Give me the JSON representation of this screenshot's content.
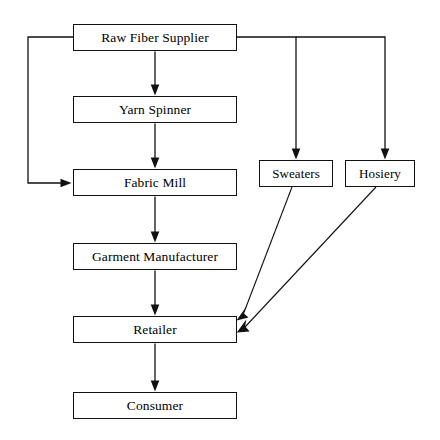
{
  "diagram": {
    "background_color": "#ffffff",
    "line_color": "#111111",
    "text_color": "#000000",
    "nodes": [
      {
        "id": "raw-fiber-supplier",
        "label": "Raw Fiber Supplier",
        "x": 73,
        "y": 24,
        "w": 164,
        "h": 27
      },
      {
        "id": "yarn-spinner",
        "label": "Yarn Spinner",
        "x": 73,
        "y": 96,
        "w": 164,
        "h": 27
      },
      {
        "id": "fabric-mill",
        "label": "Fabric Mill",
        "x": 73,
        "y": 169,
        "w": 164,
        "h": 27
      },
      {
        "id": "garment-manufacturer",
        "label": "Garment Manufacturer",
        "x": 73,
        "y": 243,
        "w": 164,
        "h": 27
      },
      {
        "id": "retailer",
        "label": "Retailer",
        "x": 73,
        "y": 316,
        "w": 164,
        "h": 27
      },
      {
        "id": "consumer",
        "label": "Consumer",
        "x": 73,
        "y": 392,
        "w": 164,
        "h": 27
      },
      {
        "id": "sweaters",
        "label": "Sweaters",
        "x": 259,
        "y": 160,
        "w": 74,
        "h": 27
      },
      {
        "id": "hosiery",
        "label": "Hosiery",
        "x": 345,
        "y": 160,
        "w": 70,
        "h": 27
      }
    ],
    "edges": [
      {
        "id": "raw-fiber-to-yarn-spinner",
        "from": "raw-fiber-supplier",
        "to": "yarn-spinner",
        "kind": "straight-down"
      },
      {
        "id": "yarn-spinner-to-fabric-mill",
        "from": "yarn-spinner",
        "to": "fabric-mill",
        "kind": "straight-down"
      },
      {
        "id": "fabric-mill-to-garment-manufacturer",
        "from": "fabric-mill",
        "to": "garment-manufacturer",
        "kind": "straight-down"
      },
      {
        "id": "garment-manufacturer-to-retailer",
        "from": "garment-manufacturer",
        "to": "retailer",
        "kind": "straight-down"
      },
      {
        "id": "retailer-to-consumer",
        "from": "retailer",
        "to": "consumer",
        "kind": "straight-down"
      },
      {
        "id": "raw-fiber-to-fabric-mill-bypass",
        "from": "raw-fiber-supplier",
        "to": "fabric-mill",
        "kind": "left-elbow"
      },
      {
        "id": "raw-fiber-to-sweaters",
        "from": "raw-fiber-supplier",
        "to": "sweaters",
        "kind": "right-elbow"
      },
      {
        "id": "raw-fiber-to-hosiery",
        "from": "raw-fiber-supplier",
        "to": "hosiery",
        "kind": "right-elbow"
      },
      {
        "id": "sweaters-to-retailer",
        "from": "sweaters",
        "to": "retailer",
        "kind": "diagonal"
      },
      {
        "id": "hosiery-to-retailer",
        "from": "hosiery",
        "to": "retailer",
        "kind": "diagonal"
      }
    ]
  }
}
